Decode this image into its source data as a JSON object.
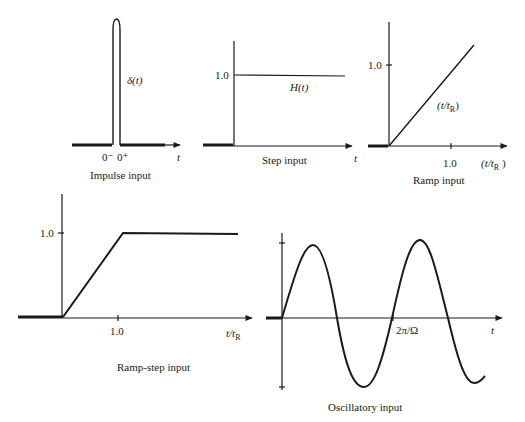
{
  "panels": {
    "impulse": {
      "caption": "Impulse input",
      "function_label": "δ(t)",
      "x_tick_minus": "0⁻",
      "x_tick_plus": "0⁺",
      "x_axis_label": "t"
    },
    "step": {
      "caption": "Step input",
      "function_label": "H(t)",
      "y_tick": "1.0",
      "x_axis_label": "t"
    },
    "ramp": {
      "caption": "Ramp input",
      "function_label": "(t/tR)",
      "function_label_main": "(t/t",
      "function_label_sub": "R",
      "function_label_close": ")",
      "y_tick": "1.0",
      "x_tick": "1.0",
      "x_axis_label_main": "(t/t",
      "x_axis_label_sub": "R",
      "x_axis_label_close": " )"
    },
    "ramp_step": {
      "caption": "Ramp-step input",
      "y_tick": "1.0",
      "x_tick": "1.0",
      "x_axis_label_main": "t/t",
      "x_axis_label_sub": "R"
    },
    "oscillatory": {
      "caption": "Oscillatory input",
      "x_tick": "2π/Ω",
      "x_axis_label": "t"
    }
  }
}
